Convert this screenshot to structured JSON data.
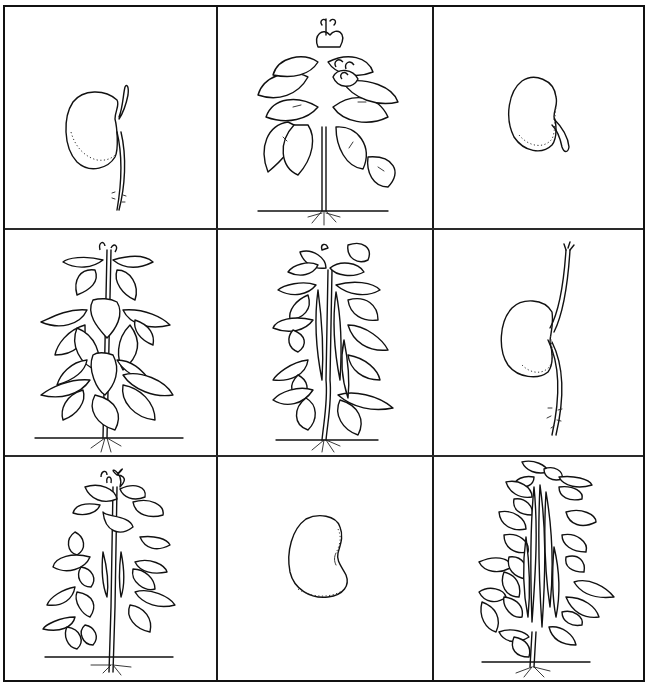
{
  "diagram": {
    "layout": {
      "rows": 3,
      "cols": 3
    },
    "line_color": "#111111",
    "background": "#ffffff",
    "cells": [
      {
        "row": 0,
        "col": 0,
        "stage": "germinating-seed-with-root",
        "description": "Bean seed with emerging root and shoot"
      },
      {
        "row": 0,
        "col": 1,
        "stage": "flowering-plant",
        "description": "Leafy bean plant with flower clusters"
      },
      {
        "row": 0,
        "col": 2,
        "stage": "seed-with-radicle",
        "description": "Bean seed with small emerging radicle"
      },
      {
        "row": 1,
        "col": 0,
        "stage": "young-leafy-plant",
        "description": "Young bean plant with heart-shaped leaves"
      },
      {
        "row": 1,
        "col": 1,
        "stage": "plant-with-young-pods",
        "description": "Bean plant developing pods"
      },
      {
        "row": 1,
        "col": 2,
        "stage": "seedling-with-long-shoot",
        "description": "Bean seed with long shoot and root"
      },
      {
        "row": 2,
        "col": 0,
        "stage": "plant-with-flowers-and-pods",
        "description": "Bean plant with flowers and small pods"
      },
      {
        "row": 2,
        "col": 1,
        "stage": "dry-seed",
        "description": "Single kidney-shaped bean seed"
      },
      {
        "row": 2,
        "col": 2,
        "stage": "mature-plant-with-pods",
        "description": "Mature bean plant with many long pods"
      }
    ]
  }
}
